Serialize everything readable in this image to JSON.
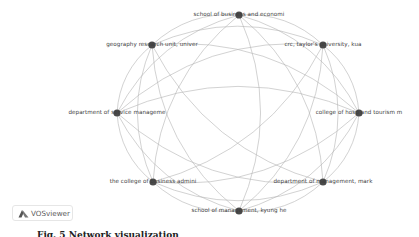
{
  "visualization": {
    "tool": "VOSviewer",
    "type": "co-authorship network (organizations)",
    "node_color": "#4a4a4a",
    "edge_color": "#b4b4b4",
    "background": "#ffffff",
    "nodes": [
      {
        "id": 0,
        "label": "school of business and economi",
        "x": 239,
        "y": 15
      },
      {
        "id": 1,
        "label": "crc, taylor's university, kua",
        "x": 323,
        "y": 45
      },
      {
        "id": 2,
        "label": "college of hosp and tourism m",
        "x": 359,
        "y": 113
      },
      {
        "id": 3,
        "label": "department of management, mark",
        "x": 323,
        "y": 182
      },
      {
        "id": 4,
        "label": "school of management, kyung he",
        "x": 239,
        "y": 211
      },
      {
        "id": 5,
        "label": "the college of business admini",
        "x": 153,
        "y": 182
      },
      {
        "id": 6,
        "label": "department of service manageme",
        "x": 117,
        "y": 113
      },
      {
        "id": 7,
        "label": "geography research unit, univer",
        "x": 152,
        "y": 45
      }
    ]
  },
  "logo": {
    "label": "VOSviewer"
  },
  "caption": {
    "text": "Fig. 5  Network visualization"
  }
}
